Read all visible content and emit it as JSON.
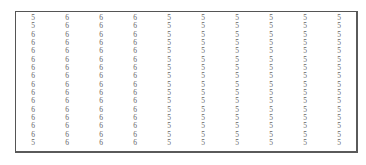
{
  "table": {
    "columns": 10,
    "rows": [
      [
        "5",
        "6",
        "6",
        "6",
        "5",
        "5",
        "5",
        "5",
        "5",
        "5"
      ],
      [
        "5",
        "6",
        "6",
        "6",
        "5",
        "5",
        "5",
        "5",
        "5",
        "5"
      ],
      [
        "6",
        "6",
        "6",
        "6",
        "5",
        "5",
        "5",
        "5",
        "5",
        "5"
      ],
      [
        "6",
        "6",
        "6",
        "6",
        "5",
        "5",
        "5",
        "5",
        "5",
        "5"
      ],
      [
        "6",
        "6",
        "6",
        "6",
        "5",
        "5",
        "5",
        "5",
        "5",
        "5"
      ],
      [
        "6",
        "6",
        "6",
        "6",
        "5",
        "5",
        "5",
        "5",
        "5",
        "5"
      ],
      [
        "6",
        "6",
        "6",
        "6",
        "5",
        "5",
        "5",
        "5",
        "5",
        "5"
      ],
      [
        "6",
        "6",
        "6",
        "6",
        "5",
        "5",
        "5",
        "5",
        "5",
        "5"
      ],
      [
        "6",
        "6",
        "6",
        "6",
        "5",
        "5",
        "5",
        "5",
        "5",
        "5"
      ],
      [
        "6",
        "6",
        "6",
        "6",
        "5",
        "5",
        "5",
        "5",
        "5",
        "5"
      ],
      [
        "6",
        "6",
        "6",
        "6",
        "5",
        "5",
        "5",
        "5",
        "5",
        "5"
      ],
      [
        "6",
        "6",
        "6",
        "6",
        "5",
        "5",
        "5",
        "5",
        "5",
        "5"
      ],
      [
        "6",
        "6",
        "6",
        "6",
        "5",
        "5",
        "5",
        "5",
        "5",
        "5"
      ],
      [
        "6",
        "6",
        "6",
        "6",
        "5",
        "5",
        "5",
        "5",
        "5",
        "5"
      ],
      [
        "6",
        "6",
        "6",
        "6",
        "5",
        "5",
        "5",
        "5",
        "5",
        "5"
      ],
      [
        "5",
        "6",
        "6",
        "6",
        "5",
        "5",
        "5",
        "5",
        "5",
        "5"
      ]
    ]
  },
  "colors": {
    "text": "#666666",
    "border": "#555555",
    "background": "#ffffff"
  }
}
